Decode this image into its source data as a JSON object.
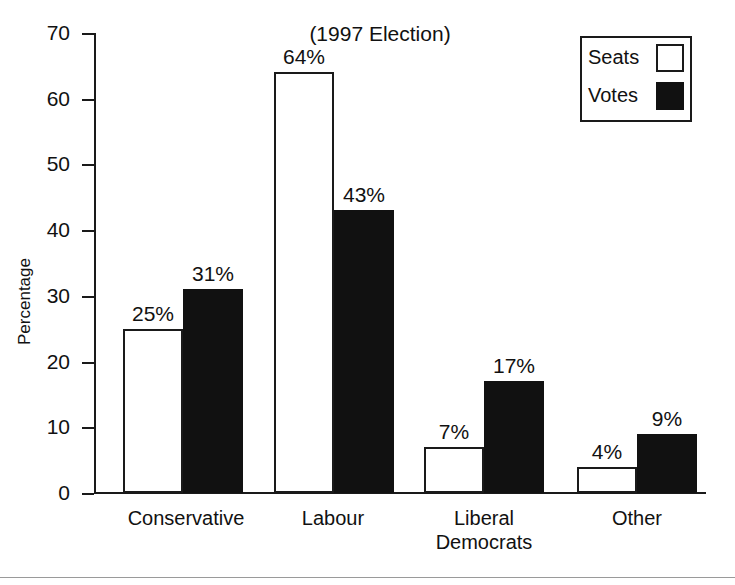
{
  "chart_data": {
    "type": "bar",
    "title": "(1997 Election)",
    "xlabel": "",
    "ylabel": "Percentage",
    "ylim": [
      0,
      70
    ],
    "ytick_labels": [
      "70",
      "60",
      "50",
      "40",
      "30",
      "20",
      "10",
      "0"
    ],
    "yticks": [
      70,
      60,
      50,
      40,
      30,
      20,
      10,
      0
    ],
    "grid": false,
    "legend_position": "top-right",
    "categories": [
      "Conservative",
      "Labour",
      "Liberal Democrats",
      "Other"
    ],
    "category_label_lines": [
      [
        "Conservative"
      ],
      [
        "Labour"
      ],
      [
        "Liberal",
        "Democrats"
      ],
      [
        "Other"
      ]
    ],
    "series": [
      {
        "name": "Seats",
        "values": [
          25,
          64,
          7,
          4
        ],
        "value_labels": [
          "25%",
          "64%",
          "7%",
          "4%"
        ],
        "color": "#ffffff",
        "edge_color": "#1a1a1a"
      },
      {
        "name": "Votes",
        "values": [
          31,
          43,
          17,
          9
        ],
        "value_labels": [
          "31%",
          "43%",
          "17%",
          "9%"
        ],
        "color": "#111111",
        "edge_color": "#111111"
      }
    ]
  },
  "legend": {
    "entries": [
      {
        "label": "Seats",
        "swatch": "open-square"
      },
      {
        "label": "Votes",
        "swatch": "filled-square"
      }
    ]
  }
}
